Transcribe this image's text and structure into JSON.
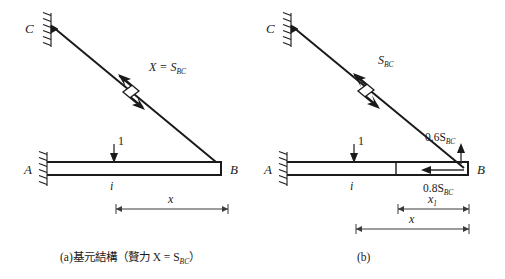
{
  "figure": {
    "background_color": "#ffffff",
    "ink_color": "#1a1a1a",
    "panels": [
      {
        "id": "panel-a",
        "caption": "(a)基元結構（贅力 X = S",
        "caption_sub": "BC",
        "caption_tail": "）",
        "caption_full": "(a)基元結構（贅力 X = SBC）",
        "nodes": {
          "c_label": "C",
          "a_label": "A",
          "b_label": "B"
        },
        "labels": {
          "unit_load": "1",
          "member_i": "i",
          "dimension_x": "x",
          "cut_force": "X = S",
          "cut_force_sub": "BC",
          "cut_force_full": "X = SBC"
        }
      },
      {
        "id": "panel-b",
        "caption": "(b)",
        "caption_full": "(b)",
        "nodes": {
          "c_label": "C",
          "a_label": "A",
          "b_label": "B"
        },
        "labels": {
          "unit_load": "1",
          "member_i": "i",
          "dimension_x": "x",
          "dimension_x1": "x",
          "dimension_x1_sub": "1",
          "dimension_x1_full": "x1",
          "cut_force": "S",
          "cut_force_sub": "BC",
          "cut_force_full": "SBC",
          "vertical_component": "0.6S",
          "vertical_component_sub": "BC",
          "vertical_component_full": "0.6SBC",
          "horizontal_component": "0.8S",
          "horizontal_component_sub": "BC",
          "horizontal_component_full": "0.8SBC"
        }
      }
    ]
  }
}
